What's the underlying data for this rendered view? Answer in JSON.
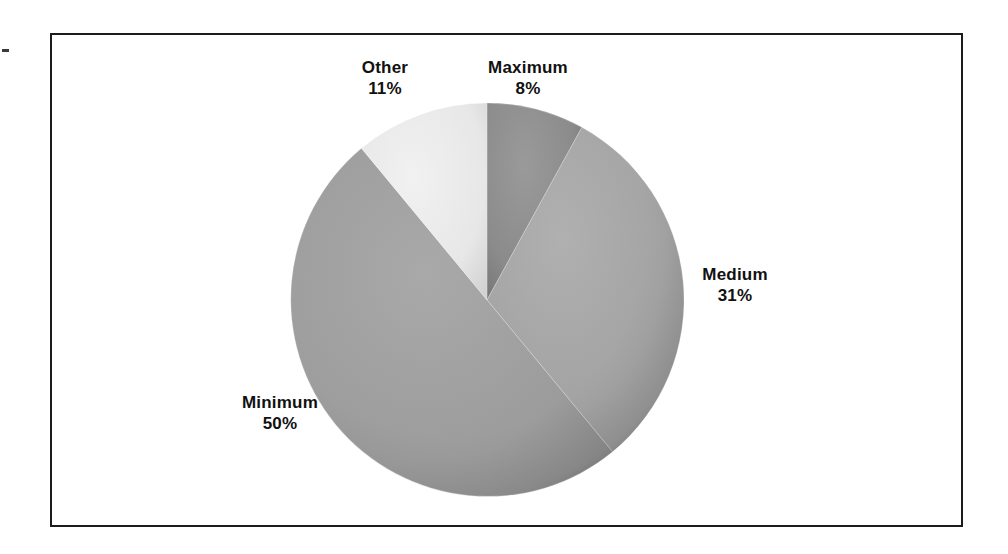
{
  "figure": {
    "background_color": "#ffffff",
    "frame_border_color": "#1c1c1c"
  },
  "chart_data": {
    "type": "pie",
    "title": "",
    "subtitle": "",
    "xlabel": "",
    "ylabel": "",
    "grid": false,
    "legend_position": "none",
    "label_format": "name_above_percent",
    "start_angle_deg": 0,
    "direction": "clockwise",
    "categories": [
      "Maximum",
      "Medium",
      "Minimum",
      "Other"
    ],
    "values": [
      8,
      31,
      50,
      11
    ],
    "unit": "%",
    "slices": [
      {
        "label": "Maximum",
        "value": 8,
        "value_text": "8%",
        "color": "#8b8b8b",
        "start_deg": 0.0,
        "end_deg": 28.8
      },
      {
        "label": "Medium",
        "value": 31,
        "value_text": "31%",
        "color": "#a3a3a3",
        "start_deg": 28.8,
        "end_deg": 140.4
      },
      {
        "label": "Minimum",
        "value": 50,
        "value_text": "50%",
        "color": "#9c9c9c",
        "start_deg": 140.4,
        "end_deg": 320.4
      },
      {
        "label": "Other",
        "value": 11,
        "value_text": "11%",
        "color": "#e7e7e7",
        "start_deg": 320.4,
        "end_deg": 360.0
      }
    ],
    "geometry": {
      "center_x": 487,
      "center_y": 300,
      "radius": 197
    }
  }
}
